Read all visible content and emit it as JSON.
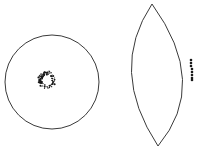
{
  "figure": {
    "width": 197,
    "height": 152,
    "background": "#ffffff",
    "stroke_color": "#3a3a3a",
    "dot_color": "#1a1a1a"
  },
  "circle_view": {
    "cx": 52,
    "cy": 82,
    "r": 47,
    "ring": {
      "cx": 45,
      "cy": 80,
      "r": 7,
      "label": "speckled ring cluster"
    }
  },
  "lens_view": {
    "top": [
      152,
      4
    ],
    "bottom": [
      158,
      146
    ],
    "left_ctrl": [
      108,
      70
    ],
    "right_ctrl": [
      210,
      84
    ],
    "dots": [
      [
        191,
        60
      ],
      [
        191,
        63
      ],
      [
        191,
        66
      ],
      [
        192,
        69
      ],
      [
        192,
        72
      ],
      [
        192,
        75
      ],
      [
        192,
        78
      ],
      [
        192,
        80
      ]
    ]
  }
}
